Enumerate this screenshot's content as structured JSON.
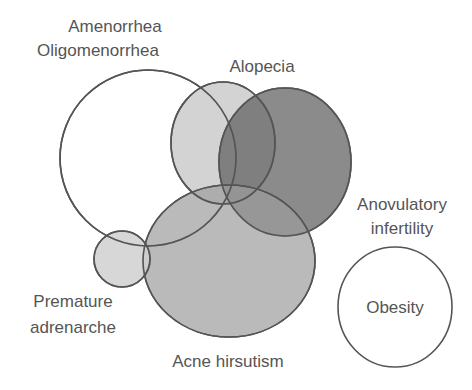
{
  "diagram": {
    "type": "venn",
    "sets": [
      {
        "id": "amenorrhea",
        "label_lines": [
          "Amenorrhea",
          "Oligomenorrhea"
        ],
        "fill": "#ffffff",
        "opacity": 1,
        "cx": 148,
        "cy": 158,
        "rx": 88,
        "ry": 88
      },
      {
        "id": "alopecia",
        "label_lines": [
          "Alopecia"
        ],
        "fill": "#c8c8c8",
        "opacity": 0.7,
        "cx": 223,
        "cy": 143,
        "rx": 52,
        "ry": 61
      },
      {
        "id": "anovulatory",
        "label_lines": [
          "Anovulatory",
          "infertility"
        ],
        "fill": "#6a6a6a",
        "opacity": 0.75,
        "cx": 285,
        "cy": 162,
        "rx": 66,
        "ry": 74
      },
      {
        "id": "acne",
        "label_lines": [
          "Acne hirsutism"
        ],
        "fill": "#9a9a9a",
        "opacity": 0.7,
        "cx": 229,
        "cy": 261,
        "rx": 86,
        "ry": 76
      },
      {
        "id": "premature",
        "label_lines": [
          "Premature",
          "adrenarche"
        ],
        "fill": "#d2d2d2",
        "opacity": 0.9,
        "cx": 122,
        "cy": 259,
        "rx": 28,
        "ry": 28
      },
      {
        "id": "obesity",
        "label_lines": [
          "Obesity"
        ],
        "fill": "#ffffff",
        "opacity": 1,
        "cx": 395,
        "cy": 307,
        "rx": 57,
        "ry": 60
      }
    ],
    "labels": {
      "amenorrhea_1": "Amenorrhea",
      "amenorrhea_2": "Oligomenorrhea",
      "alopecia": "Alopecia",
      "anovulatory_1": "Anovulatory",
      "anovulatory_2": "infertility",
      "premature_1": "Premature",
      "premature_2": "adrenarche",
      "acne": "Acne hirsutism",
      "obesity": "Obesity"
    },
    "stroke_color": "#555555"
  }
}
